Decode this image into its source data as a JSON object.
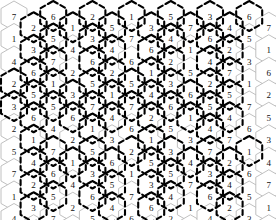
{
  "diagram": {
    "type": "hex-grid-puzzle",
    "symbol_set": [
      1,
      2,
      3,
      4,
      5,
      6,
      7
    ],
    "colors": {
      "background": "#ffffff",
      "cell_fill": "#ffffff",
      "cell_stroke": "#b9b9b9",
      "region_stroke": "#000000",
      "digit": "#111111"
    },
    "geometry": {
      "hex_width": 26,
      "hex_height": 30,
      "column_step": 19.6,
      "row_step": 22.5,
      "column_offset": 11.25,
      "origin_x": 14,
      "origin_y": 16,
      "orientation": "pointy-top",
      "columns": 14,
      "rows": 10
    },
    "columns": [
      {
        "index": 0,
        "offset": false,
        "values": [
          7,
          1,
          4,
          2,
          3,
          2,
          5,
          7,
          1,
          4
        ]
      },
      {
        "index": 1,
        "offset": true,
        "values": [
          2,
          3,
          6,
          5,
          6,
          1,
          4,
          2,
          3,
          6
        ]
      },
      {
        "index": 2,
        "offset": false,
        "values": [
          6,
          5,
          7,
          1,
          5,
          4,
          7,
          6,
          5,
          7
        ]
      },
      {
        "index": 3,
        "offset": true,
        "values": [
          1,
          4,
          2,
          3,
          6,
          2,
          1,
          4,
          2,
          3
        ]
      },
      {
        "index": 4,
        "offset": false,
        "values": [
          2,
          3,
          6,
          5,
          7,
          1,
          5,
          3,
          6,
          5
        ]
      },
      {
        "index": 5,
        "offset": true,
        "values": [
          5,
          4,
          2,
          1,
          4,
          3,
          6,
          5,
          4,
          2
        ]
      },
      {
        "index": 6,
        "offset": false,
        "values": [
          1,
          7,
          6,
          5,
          7,
          6,
          2,
          1,
          7,
          6
        ]
      },
      {
        "index": 7,
        "offset": true,
        "values": [
          3,
          6,
          1,
          4,
          2,
          1,
          5,
          3,
          6,
          1
        ]
      },
      {
        "index": 8,
        "offset": false,
        "values": [
          5,
          4,
          2,
          3,
          6,
          5,
          3,
          5,
          4,
          2
        ]
      },
      {
        "index": 9,
        "offset": true,
        "values": [
          7,
          1,
          5,
          6,
          1,
          3,
          4,
          7,
          1,
          5
        ]
      },
      {
        "index": 10,
        "offset": false,
        "values": [
          3,
          6,
          4,
          2,
          5,
          4,
          7,
          3,
          6,
          4
        ]
      },
      {
        "index": 11,
        "offset": true,
        "values": [
          4,
          2,
          7,
          5,
          4,
          7,
          2,
          4,
          2,
          7
        ]
      },
      {
        "index": 12,
        "offset": false,
        "values": [
          6,
          5,
          3,
          1,
          7,
          6,
          1,
          6,
          5,
          3
        ]
      },
      {
        "index": 13,
        "offset": true,
        "values": [
          7,
          1,
          6,
          2,
          5,
          3,
          4,
          7,
          1,
          4
        ]
      }
    ],
    "regions": [
      {
        "name": "region-1",
        "cells": [
          [
            1,
            0
          ],
          [
            2,
            0
          ],
          [
            1,
            1
          ],
          [
            2,
            1
          ],
          [
            1,
            2
          ],
          [
            2,
            2
          ],
          [
            3,
            0
          ]
        ]
      },
      {
        "name": "region-2",
        "cells": [
          [
            4,
            0
          ],
          [
            5,
            0
          ],
          [
            4,
            1
          ],
          [
            5,
            1
          ],
          [
            4,
            2
          ],
          [
            5,
            2
          ],
          [
            6,
            0
          ]
        ]
      },
      {
        "name": "region-3",
        "cells": [
          [
            7,
            0
          ],
          [
            8,
            0
          ],
          [
            7,
            1
          ],
          [
            8,
            1
          ],
          [
            7,
            2
          ],
          [
            8,
            2
          ],
          [
            9,
            0
          ]
        ]
      },
      {
        "name": "region-4",
        "cells": [
          [
            10,
            0
          ],
          [
            11,
            0
          ],
          [
            10,
            1
          ],
          [
            11,
            1
          ],
          [
            10,
            2
          ],
          [
            11,
            2
          ],
          [
            12,
            0
          ]
        ]
      },
      {
        "name": "region-5",
        "cells": [
          [
            0,
            3
          ],
          [
            1,
            3
          ],
          [
            0,
            4
          ],
          [
            1,
            4
          ],
          [
            2,
            3
          ],
          [
            2,
            4
          ],
          [
            1,
            5
          ]
        ]
      },
      {
        "name": "region-6",
        "cells": [
          [
            3,
            3
          ],
          [
            4,
            3
          ],
          [
            3,
            4
          ],
          [
            4,
            4
          ],
          [
            5,
            3
          ],
          [
            5,
            4
          ],
          [
            4,
            5
          ]
        ]
      },
      {
        "name": "region-7",
        "cells": [
          [
            6,
            3
          ],
          [
            7,
            3
          ],
          [
            6,
            4
          ],
          [
            7,
            4
          ],
          [
            8,
            3
          ],
          [
            8,
            4
          ],
          [
            7,
            5
          ]
        ]
      },
      {
        "name": "region-8",
        "cells": [
          [
            9,
            3
          ],
          [
            10,
            3
          ],
          [
            9,
            4
          ],
          [
            10,
            4
          ],
          [
            11,
            3
          ],
          [
            11,
            4
          ],
          [
            10,
            5
          ]
        ]
      },
      {
        "name": "region-9",
        "cells": [
          [
            1,
            6
          ],
          [
            2,
            6
          ],
          [
            1,
            7
          ],
          [
            2,
            7
          ],
          [
            1,
            8
          ],
          [
            2,
            8
          ],
          [
            3,
            6
          ]
        ]
      },
      {
        "name": "region-10",
        "cells": [
          [
            4,
            6
          ],
          [
            5,
            6
          ],
          [
            4,
            7
          ],
          [
            5,
            7
          ],
          [
            4,
            8
          ],
          [
            5,
            8
          ],
          [
            6,
            6
          ]
        ]
      },
      {
        "name": "region-11",
        "cells": [
          [
            7,
            6
          ],
          [
            8,
            6
          ],
          [
            7,
            7
          ],
          [
            8,
            7
          ],
          [
            7,
            8
          ],
          [
            8,
            8
          ],
          [
            9,
            6
          ]
        ]
      },
      {
        "name": "region-12",
        "cells": [
          [
            10,
            6
          ],
          [
            11,
            6
          ],
          [
            10,
            7
          ],
          [
            11,
            7
          ],
          [
            10,
            8
          ],
          [
            11,
            8
          ],
          [
            12,
            6
          ]
        ]
      }
    ]
  }
}
